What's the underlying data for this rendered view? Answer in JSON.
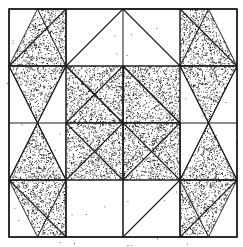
{
  "diagram": {
    "type": "quilt-block",
    "width": 243,
    "height": 247,
    "background_color": "#ffffff",
    "line_color": "#1a1a1a",
    "fill_color": "#3a3a3a",
    "fill_style": "stipple",
    "stipple_density": 0.46,
    "speckle_density": 0.0016,
    "symmetry": "180-degree rotational",
    "grid": {
      "rows": 4,
      "cols": 4,
      "x_lines": [
        9,
        66,
        123,
        180,
        237
      ],
      "y_lines": [
        9,
        66,
        123,
        180,
        237
      ],
      "outer_border_width": 1.6,
      "inner_line_width": 1.0
    },
    "shapes": [
      {
        "name": "tl-diamond-top-left",
        "points": "9,66 37.5,9 66,66"
      },
      {
        "name": "tl-diamond-top-right",
        "points": "66,66 37.5,9 66,9"
      },
      {
        "name": "tl-diamond-upper-wedge",
        "points": "9,66 66,66 37.5,123"
      },
      {
        "name": "tl-band-square",
        "points": "66,66 123,66 123,123 66,123"
      },
      {
        "name": "tl-band-triangle-right",
        "points": "123,66 180,123 123,123"
      },
      {
        "name": "tl-lower-wedge",
        "points": "66,123 123,123 66,180"
      },
      {
        "name": "tr-diamond-top-right",
        "points": "237,66 208.5,9 180,66"
      },
      {
        "name": "tr-diamond-top-left",
        "points": "180,66 208.5,9 180,9"
      },
      {
        "name": "tr-diamond-upper-wedge",
        "points": "237,66 180,66 208.5,123"
      },
      {
        "name": "tr-band-square",
        "points": "123,66 180,66 180,123 123,123"
      },
      {
        "name": "tr-band-triangle-left",
        "points": "123,66 66,123 123,123"
      },
      {
        "name": "tr-lower-wedge",
        "points": "180,123 123,123 180,180"
      },
      {
        "name": "bl-diamond-bottom-left",
        "points": "9,180 37.5,237 66,180"
      },
      {
        "name": "bl-diamond-bottom-right",
        "points": "66,180 37.5,237 66,237"
      },
      {
        "name": "bl-diamond-lower-wedge",
        "points": "9,180 66,180 37.5,123"
      },
      {
        "name": "bl-band-square",
        "points": "66,123 123,123 123,180 66,180"
      },
      {
        "name": "bl-band-triangle-right",
        "points": "123,180 180,123 123,123"
      },
      {
        "name": "br-diamond-bottom-right",
        "points": "237,180 208.5,237 180,180"
      },
      {
        "name": "br-diamond-bottom-left",
        "points": "180,180 208.5,237 180,237"
      },
      {
        "name": "br-diamond-lower-wedge",
        "points": "237,180 180,180 208.5,123"
      },
      {
        "name": "br-band-square",
        "points": "123,123 180,123 180,180 123,180"
      },
      {
        "name": "br-band-triangle-left",
        "points": "123,180 66,123 123,123"
      }
    ],
    "seam_lines": [
      "9,66 66,9",
      "66,9 66,66",
      "9,66 66,66",
      "66,66 37.5,123",
      "9,66 37.5,123",
      "66,66 123,123",
      "123,66 180,123",
      "123,66 123,123",
      "66,123 123,66",
      "66,180 123,123",
      "180,66 123,9",
      "123,9 180,9",
      "237,66 180,9",
      "180,66 237,66",
      "180,66 208.5,123",
      "237,66 208.5,123",
      "180,123 123,66",
      "180,123 180,180",
      "123,180 180,123",
      "9,180 66,237",
      "66,237 66,180",
      "9,180 66,180",
      "66,180 37.5,123",
      "9,180 37.5,123",
      "66,123 123,180",
      "123,180 123,123",
      "237,180 180,237",
      "180,237 180,180",
      "237,180 180,180",
      "180,180 208.5,123",
      "237,180 208.5,123",
      "123,123 180,180",
      "66,66 123,9",
      "123,123 66,66",
      "180,180 123,237",
      "123,237 123,180"
    ]
  }
}
